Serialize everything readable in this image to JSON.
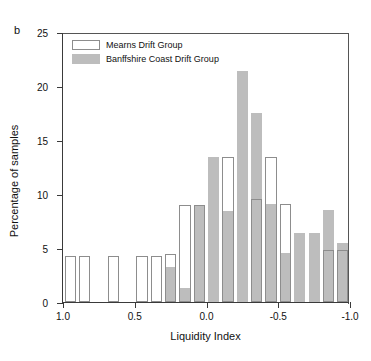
{
  "panel_label": "b",
  "legend": {
    "position": "top-left",
    "entries": [
      {
        "label": "Mearns Drift Group",
        "swatch": "white",
        "color": "#ffffff"
      },
      {
        "label": "Banffshire Coast Drift Group",
        "swatch": "gray",
        "color": "#bdbdbd"
      }
    ]
  },
  "axes": {
    "y": {
      "label": "Percentage of samples",
      "ticks": [
        "0",
        "5",
        "10",
        "15",
        "20",
        "25"
      ],
      "tick_values": [
        0,
        5,
        10,
        15,
        20,
        25
      ],
      "min": 0,
      "max": 25
    },
    "x": {
      "label": "Liquidity Index",
      "ticks": [
        "1.0",
        "0.5",
        "0.0",
        "-0.5",
        "-1.0"
      ],
      "tick_values": [
        1.0,
        0.5,
        0.0,
        -0.5,
        -1.0
      ],
      "min": 1.0,
      "max": -1.0,
      "reversed": true
    }
  },
  "chart_data": {
    "type": "bar",
    "title": "",
    "subtitle": "",
    "xlabel": "Liquidity Index",
    "ylabel": "Percentage of samples",
    "xlim": [
      1.0,
      -1.0
    ],
    "ylim": [
      0,
      25
    ],
    "grid": false,
    "legend_position": "top-left",
    "bin_width": 0.1,
    "categories": [
      "1.0 to 0.9",
      "0.9 to 0.8",
      "0.8 to 0.7",
      "0.7 to 0.6",
      "0.6 to 0.5",
      "0.5 to 0.4",
      "0.4 to 0.3",
      "0.3 to 0.2",
      "0.2 to 0.1",
      "0.1 to 0.0",
      "0.0 to -0.1",
      "-0.1 to -0.2",
      "-0.2 to -0.3",
      "-0.3 to -0.4",
      "-0.4 to -0.5",
      "-0.5 to -0.6",
      "-0.6 to -0.7",
      "-0.7 to -0.8",
      "-0.8 to -0.9",
      "-0.9 to -1.0"
    ],
    "bin_centers": [
      0.95,
      0.85,
      0.75,
      0.65,
      0.55,
      0.45,
      0.35,
      0.25,
      0.15,
      0.05,
      -0.05,
      -0.15,
      -0.25,
      -0.35,
      -0.45,
      -0.55,
      -0.65,
      -0.75,
      -0.85,
      -0.95
    ],
    "series": [
      {
        "name": "Mearns Drift Group",
        "color": "#ffffff",
        "edge_color": "#8d8d8d",
        "values": [
          4.3,
          4.3,
          0,
          4.3,
          0,
          4.3,
          4.3,
          4.4,
          9.0,
          9.0,
          0,
          13.4,
          0,
          9.5,
          13.4,
          9.1,
          0,
          0,
          4.8,
          4.8
        ]
      },
      {
        "name": "Banffshire Coast Drift Group",
        "color": "#bdbdbd",
        "values": [
          0,
          0,
          0,
          0,
          0,
          0,
          0,
          3.2,
          1.3,
          9.0,
          13.4,
          8.4,
          21.4,
          17.5,
          9.1,
          4.5,
          6.4,
          6.4,
          8.5,
          5.5
        ]
      }
    ]
  }
}
